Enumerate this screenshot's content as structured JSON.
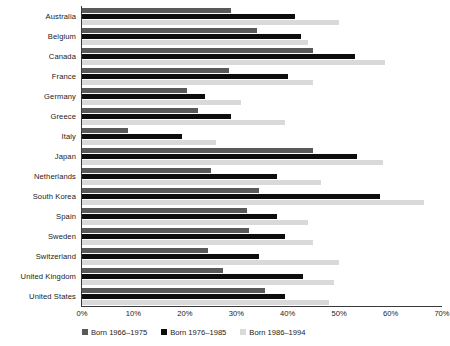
{
  "chart_data": {
    "type": "bar",
    "orientation": "horizontal",
    "title": "",
    "xlabel": "",
    "ylabel": "",
    "xlim": [
      0,
      70
    ],
    "xticks": [
      0,
      10,
      20,
      30,
      40,
      50,
      60,
      70
    ],
    "xtick_labels": [
      "0%",
      "10%",
      "20%",
      "30%",
      "40%",
      "50%",
      "60%",
      "70%"
    ],
    "grid": false,
    "legend_position": "bottom",
    "categories": [
      "Australia",
      "Belgium",
      "Canada",
      "France",
      "Germany",
      "Greece",
      "Italy",
      "Japan",
      "Netherlands",
      "South Korea",
      "Spain",
      "Sweden",
      "Switzerland",
      "United Kingdom",
      "United States"
    ],
    "series": [
      {
        "name": "Born 1966–1975",
        "color": "#595959",
        "values": [
          29,
          34,
          45,
          28.5,
          20.5,
          22.5,
          9,
          45,
          25,
          34.5,
          32,
          32.5,
          24.5,
          27.5,
          35.5
        ]
      },
      {
        "name": "Born 1976–1985",
        "color": "#0d0d0d",
        "values": [
          41.5,
          42.5,
          53,
          40,
          24,
          29,
          19.5,
          53.5,
          38,
          58,
          38,
          39.5,
          34.5,
          43,
          39.5
        ]
      },
      {
        "name": "Born 1986–1994",
        "color": "#d9d9d9",
        "values": [
          50,
          44,
          59,
          45,
          31,
          39.5,
          26,
          58.5,
          46.5,
          66.5,
          44,
          45,
          50,
          49,
          48
        ]
      }
    ]
  }
}
